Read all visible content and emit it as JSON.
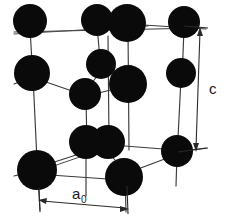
{
  "figure": {
    "background_color": "#ffffff",
    "atom_color": "#0a0a0a",
    "bond_color": "#3a3a3a",
    "label_color": "#1a1a1a",
    "width": 232,
    "height": 222
  },
  "labels": {
    "c_axis": "c",
    "a_axis_base": "a",
    "a_axis_subscript": "0"
  },
  "dimensions": {
    "c_arrow": {
      "x1": 200,
      "y1": 30,
      "x2": 196,
      "y2": 150,
      "label_x": 210,
      "label_y": 88
    },
    "a0_arrow": {
      "x1": 38,
      "y1": 200,
      "x2": 128,
      "y2": 208,
      "label_x": 76,
      "label_y": 196
    }
  },
  "atoms": [
    {
      "id": "top-back-left",
      "cx": 30,
      "cy": 21,
      "r": 17
    },
    {
      "id": "top-back-midA",
      "cx": 97,
      "cy": 20,
      "r": 16
    },
    {
      "id": "top-back-midB",
      "cx": 127,
      "cy": 23,
      "r": 19
    },
    {
      "id": "top-back-right",
      "cx": 184,
      "cy": 22,
      "r": 16
    },
    {
      "id": "mid-front-left",
      "cx": 32,
      "cy": 73,
      "r": 18
    },
    {
      "id": "interior-upper",
      "cx": 101,
      "cy": 64,
      "r": 15
    },
    {
      "id": "interior-right",
      "cx": 128,
      "cy": 84,
      "r": 19
    },
    {
      "id": "interior-left",
      "cx": 85,
      "cy": 94,
      "r": 16
    },
    {
      "id": "mid-right",
      "cx": 181,
      "cy": 73,
      "r": 15
    },
    {
      "id": "bottom-backA",
      "cx": 86,
      "cy": 142,
      "r": 17
    },
    {
      "id": "bottom-backB",
      "cx": 108,
      "cy": 142,
      "r": 17
    },
    {
      "id": "bottom-front-left",
      "cx": 37,
      "cy": 170,
      "r": 20
    },
    {
      "id": "bottom-front-mid",
      "cx": 124,
      "cy": 177,
      "r": 19
    },
    {
      "id": "bottom-right",
      "cx": 177,
      "cy": 151,
      "r": 16
    }
  ],
  "bonds": [
    {
      "from": "top-back-left",
      "to": "top-back-midA",
      "kind": "edge-top"
    },
    {
      "from": "top-back-midB",
      "to": "top-back-right",
      "kind": "edge-top"
    },
    {
      "from": "top-back-left",
      "to": "mid-front-left",
      "kind": "vertical"
    },
    {
      "from": "top-back-midA",
      "to": "interior-upper",
      "kind": "vertical"
    },
    {
      "from": "top-back-midB",
      "to": "interior-right",
      "kind": "vertical"
    },
    {
      "from": "top-back-right",
      "to": "mid-right",
      "kind": "vertical"
    },
    {
      "from": "interior-upper",
      "to": "interior-left",
      "kind": "tetra"
    },
    {
      "from": "interior-left",
      "to": "mid-front-left",
      "kind": "tetra"
    },
    {
      "from": "interior-left",
      "to": "interior-right",
      "kind": "tetra"
    },
    {
      "from": "interior-left",
      "to": "bottom-backA",
      "kind": "vertical"
    },
    {
      "from": "interior-right",
      "to": "bottom-front-mid",
      "kind": "vertical"
    },
    {
      "from": "mid-front-left",
      "to": "bottom-front-left",
      "kind": "vertical"
    },
    {
      "from": "mid-right",
      "to": "bottom-right",
      "kind": "vertical"
    },
    {
      "from": "bottom-front-left",
      "to": "bottom-backB",
      "kind": "edge-bottom"
    },
    {
      "from": "bottom-front-left",
      "to": "bottom-front-mid",
      "kind": "edge-bottom"
    },
    {
      "from": "bottom-backB",
      "to": "bottom-right",
      "kind": "edge-bottom"
    },
    {
      "from": "bottom-front-mid",
      "to": "bottom-right",
      "kind": "edge-bottom"
    }
  ]
}
